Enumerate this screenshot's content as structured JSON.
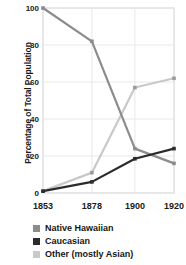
{
  "chart_data": {
    "type": "line",
    "title": "",
    "xlabel": "",
    "ylabel": "Percentage of Total Population",
    "categories": [
      "1853",
      "1878",
      "1900",
      "1920"
    ],
    "x": [
      1853,
      1878,
      1900,
      1920
    ],
    "xlim": [
      1853,
      1920
    ],
    "ylim": [
      0,
      100
    ],
    "yticks": [
      0,
      20,
      40,
      60,
      80,
      100
    ],
    "ytick_labels": [
      "0",
      "20",
      "40",
      "60",
      "80",
      "100"
    ],
    "xtick_labels": [
      "1853",
      "1878",
      "1900",
      "1920"
    ],
    "grid": true,
    "legend_position": "bottom-left",
    "series": [
      {
        "name": "Native Hawaiian",
        "color": "#8c8c8c",
        "values": [
          100,
          82,
          24,
          16
        ]
      },
      {
        "name": "Caucasian",
        "color": "#2b2b2b",
        "values": [
          1,
          6,
          18.5,
          24
        ]
      },
      {
        "name": "Other (mostly Asian)",
        "color": "#c9c9c9",
        "values": [
          1,
          11,
          57,
          62
        ]
      }
    ]
  },
  "axis": {
    "y_title": "Percentage of Total Population",
    "y_tick_0": "0",
    "y_tick_1": "20",
    "y_tick_2": "40",
    "y_tick_3": "60",
    "y_tick_4": "80",
    "y_tick_5": "100",
    "x_tick_0": "1853",
    "x_tick_1": "1878",
    "x_tick_2": "1900",
    "x_tick_3": "1920"
  },
  "legend": {
    "items": [
      {
        "label": "Native Hawaiian",
        "color": "#8c8c8c"
      },
      {
        "label": "Caucasian",
        "color": "#2b2b2b"
      },
      {
        "label": "Other (mostly Asian)",
        "color": "#c9c9c9"
      }
    ]
  },
  "colors": {
    "frame": "#cfcfcf",
    "grid": "#e8e8e8",
    "text": "#1a1a1a",
    "background": "#ffffff"
  }
}
